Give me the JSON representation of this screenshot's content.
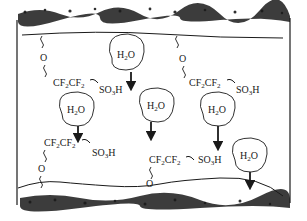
{
  "diagram": {
    "type": "membrane-cross-section",
    "colors": {
      "ink": "#1a1a1a",
      "background": "#ffffff"
    },
    "water_molecules": [
      {
        "label": "H",
        "sub": "2",
        "tail": "O",
        "cx": 126,
        "cy": 56
      },
      {
        "label": "H",
        "sub": "2",
        "tail": "O",
        "cx": 77,
        "cy": 112
      },
      {
        "label": "H",
        "sub": "2",
        "tail": "O",
        "cx": 158,
        "cy": 107
      },
      {
        "label": "H",
        "sub": "2",
        "tail": "O",
        "cx": 218,
        "cy": 111
      },
      {
        "label": "H",
        "sub": "2",
        "tail": "O",
        "cx": 250,
        "cy": 157
      }
    ],
    "side_chains": [
      {
        "chain_a": "CF",
        "chain_sub_a": "2",
        "chain_b": "CF",
        "chain_sub_b": "2",
        "acid": "SO",
        "acid_sub": "3",
        "acid_tail": "H",
        "oxygen": "O"
      },
      {
        "chain_a": "CF",
        "chain_sub_a": "2",
        "chain_b": "CF",
        "chain_sub_b": "2",
        "acid": "SO",
        "acid_sub": "3",
        "acid_tail": "H",
        "oxygen": "O"
      },
      {
        "chain_a": "CF",
        "chain_sub_a": "2",
        "chain_b": "CF",
        "chain_sub_b": "2",
        "acid": "SO",
        "acid_sub": "3",
        "acid_tail": "H",
        "oxygen": "O"
      },
      {
        "chain_a": "CF",
        "chain_sub_a": "2",
        "chain_b": "CF",
        "chain_sub_b": "2",
        "acid": "SO",
        "acid_sub": "3",
        "acid_tail": "H",
        "oxygen": "O"
      }
    ]
  }
}
